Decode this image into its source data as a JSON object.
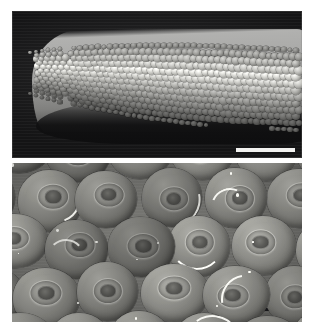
{
  "figure": {
    "caption": "",
    "background_color": "#ffffff",
    "width_px": 313,
    "height_px": 335,
    "panel_count": 2
  },
  "panels": [
    {
      "id": "top",
      "label": "",
      "description": "Low-magnification SEM view of the rounded distal tip of an elongate arthropod appendage, densely covered by a mosaic of convex dome-shaped facets",
      "imaging_mode": "Scanning electron microscopy (secondary electron)",
      "background_color": "#1b1b1c",
      "specimen_color": "#a9a9a5",
      "orientation": "tip at left, shaft extending to the right",
      "scale_bar": {
        "present": true,
        "label": "",
        "color": "#f2f2f0",
        "position": "lower right",
        "length_px": 59,
        "thickness_px": 4
      }
    },
    {
      "id": "bottom",
      "label": "",
      "description": "High-magnification SEM close-up of the individual dome facets, each bearing a concentric central ring and pit, separated by dark grooves with bright crescent rims",
      "imaging_mode": "Scanning electron microscopy (secondary electron)",
      "background_color": "#6d6d6a",
      "specimen_color": "#797975",
      "orientation": "en face view of the facet surface",
      "scale_bar": {
        "present": true,
        "label": "",
        "color": "#17171a",
        "position": "lower right",
        "length_px": 78,
        "thickness_px": 3
      }
    }
  ],
  "annotations": {
    "text_labels": [],
    "arrows": [],
    "letters": []
  }
}
